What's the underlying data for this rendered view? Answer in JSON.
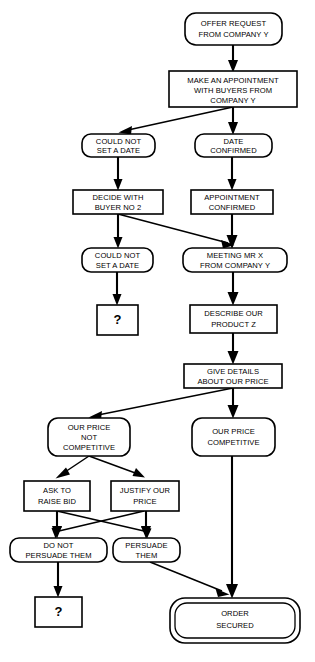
{
  "diagram": {
    "type": "flowchart",
    "background_color": "#ffffff",
    "line_color": "#000000",
    "node_fill": "#ffffff"
  },
  "nodes": [
    {
      "id": "offer_request",
      "shape": "rounded",
      "lines": [
        "OFFER REQUEST",
        "FROM COMPANY Y"
      ]
    },
    {
      "id": "make_appointment",
      "shape": "rect",
      "lines": [
        "MAKE AN APPOINTMENT",
        "WITH BUYERS FROM",
        "COMPANY Y"
      ]
    },
    {
      "id": "could_not_set_date_1",
      "shape": "rounded",
      "lines": [
        "COULD NOT",
        "SET A DATE"
      ]
    },
    {
      "id": "date_confirmed",
      "shape": "rounded",
      "lines": [
        "DATE",
        "CONFIRMED"
      ]
    },
    {
      "id": "decide_with_buyer",
      "shape": "rect",
      "lines": [
        "DECIDE WITH",
        "BUYER NO 2"
      ]
    },
    {
      "id": "appointment_confirmed",
      "shape": "rect",
      "lines": [
        "APPOINTMENT",
        "CONFIRMED"
      ]
    },
    {
      "id": "could_not_set_date_2",
      "shape": "rounded",
      "lines": [
        "COULD NOT",
        "SET A DATE"
      ]
    },
    {
      "id": "meeting_mr_x",
      "shape": "rounded",
      "lines": [
        "MEETING MR X",
        "FROM COMPANY Y"
      ]
    },
    {
      "id": "question_1",
      "shape": "rect",
      "lines": [
        "?"
      ]
    },
    {
      "id": "describe_product",
      "shape": "rect",
      "lines": [
        "DESCRIBE OUR",
        "PRODUCT Z"
      ]
    },
    {
      "id": "give_details_price",
      "shape": "rect",
      "lines": [
        "GIVE DETAILS",
        "ABOUT OUR PRICE"
      ]
    },
    {
      "id": "price_not_competitive",
      "shape": "rounded",
      "lines": [
        "OUR PRICE",
        "NOT",
        "COMPETITIVE"
      ]
    },
    {
      "id": "price_competitive",
      "shape": "rounded",
      "lines": [
        "OUR PRICE",
        "COMPETITIVE"
      ]
    },
    {
      "id": "ask_raise_bid",
      "shape": "rect",
      "lines": [
        "ASK TO",
        "RAISE BID"
      ]
    },
    {
      "id": "justify_price",
      "shape": "rect",
      "lines": [
        "JUSTIFY OUR",
        "PRICE"
      ]
    },
    {
      "id": "do_not_persuade",
      "shape": "rounded",
      "lines": [
        "DO NOT",
        "PERSUADE THEM"
      ]
    },
    {
      "id": "persuade_them",
      "shape": "rounded",
      "lines": [
        "PERSUADE",
        "THEM"
      ]
    },
    {
      "id": "question_2",
      "shape": "rect",
      "lines": [
        "?"
      ]
    },
    {
      "id": "order_secured",
      "shape": "rounded-double",
      "lines": [
        "ORDER",
        "SECURED"
      ]
    }
  ],
  "edges": [
    {
      "from": "offer_request",
      "to": "make_appointment"
    },
    {
      "from": "make_appointment",
      "to": "date_confirmed"
    },
    {
      "from": "make_appointment",
      "to": "could_not_set_date_1"
    },
    {
      "from": "could_not_set_date_1",
      "to": "decide_with_buyer"
    },
    {
      "from": "date_confirmed",
      "to": "appointment_confirmed"
    },
    {
      "from": "decide_with_buyer",
      "to": "could_not_set_date_2"
    },
    {
      "from": "decide_with_buyer",
      "to": "meeting_mr_x"
    },
    {
      "from": "appointment_confirmed",
      "to": "meeting_mr_x"
    },
    {
      "from": "could_not_set_date_2",
      "to": "question_1"
    },
    {
      "from": "meeting_mr_x",
      "to": "describe_product"
    },
    {
      "from": "describe_product",
      "to": "give_details_price"
    },
    {
      "from": "give_details_price",
      "to": "price_competitive"
    },
    {
      "from": "give_details_price",
      "to": "price_not_competitive"
    },
    {
      "from": "price_not_competitive",
      "to": "ask_raise_bid"
    },
    {
      "from": "price_not_competitive",
      "to": "justify_price"
    },
    {
      "from": "ask_raise_bid",
      "to": "do_not_persuade"
    },
    {
      "from": "ask_raise_bid",
      "to": "persuade_them"
    },
    {
      "from": "justify_price",
      "to": "do_not_persuade"
    },
    {
      "from": "justify_price",
      "to": "persuade_them"
    },
    {
      "from": "do_not_persuade",
      "to": "question_2"
    },
    {
      "from": "persuade_them",
      "to": "order_secured"
    },
    {
      "from": "price_competitive",
      "to": "order_secured"
    }
  ]
}
